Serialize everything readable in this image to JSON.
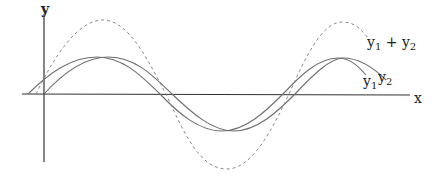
{
  "diagram": {
    "type": "wave superposition",
    "axes": {
      "x_label": "x",
      "y_label": "y"
    },
    "curves": [
      {
        "name": "y1",
        "label": "y",
        "sub": "1",
        "style": "solid",
        "color": "#6a6a6a"
      },
      {
        "name": "y2",
        "label": "y",
        "sub": "2",
        "style": "solid",
        "color": "#6a6a6a"
      },
      {
        "name": "y1 + y2",
        "label_parts": [
          "y",
          "1",
          " + y",
          "2"
        ],
        "style": "dashed",
        "color": "#8a8a8a"
      }
    ],
    "sum_label": {
      "a": "y",
      "a_sub": "1",
      "plus": " + ",
      "b": "y",
      "b_sub": "2"
    }
  }
}
